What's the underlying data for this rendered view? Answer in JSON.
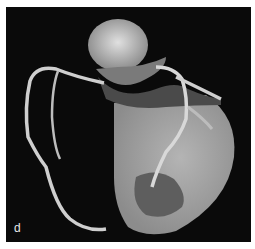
{
  "figure": {
    "panel_label": "d",
    "colors": {
      "background": "#0a0a0a",
      "border": "#ffffff",
      "myocardium": "#a8a8a8",
      "vessels": "#d8d8d8",
      "perfusion_defect": "#5a5a5a"
    }
  }
}
